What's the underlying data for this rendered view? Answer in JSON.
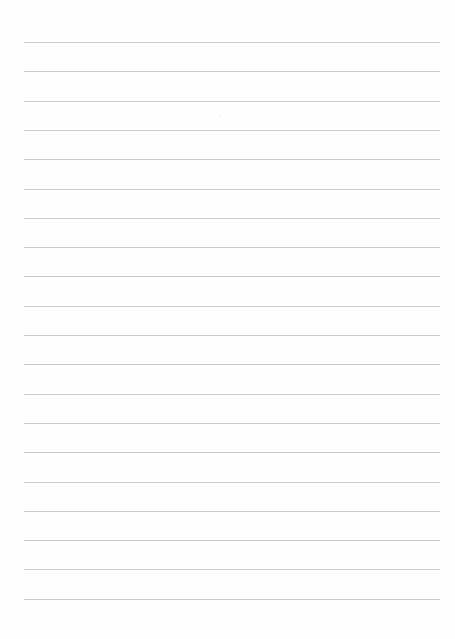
{
  "document": {
    "type": "lined-paper",
    "line_count": 20,
    "first_line_y": 42,
    "line_spacing": 29.3,
    "line_color": "#c9c9c9",
    "background": "#fefefe"
  }
}
